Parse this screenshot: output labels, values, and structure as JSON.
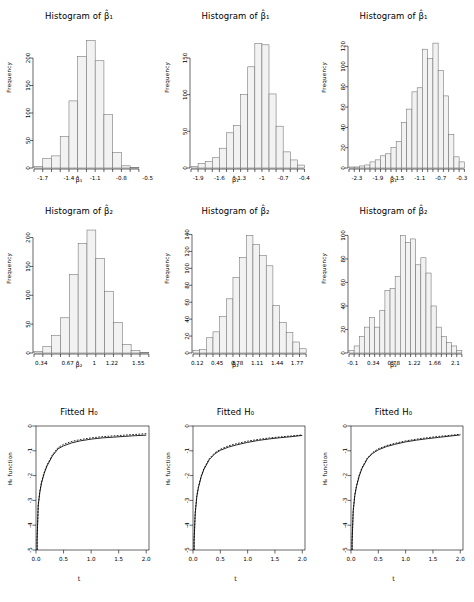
{
  "figure": {
    "layout": "3x3 panel grid",
    "rows": 3,
    "cols": 3
  },
  "labels": {
    "frequency": "Frequency",
    "h0_function": "H₀ function",
    "t": "t",
    "beta1_hat": "β̂₁",
    "beta2_hat": "β̂₂",
    "hist_title_b1": "Histogram of β̂₁",
    "hist_title_b2": "Histogram of β̂₂",
    "fitted_title": "Fitted H₀"
  },
  "chart_data": [
    {
      "id": "hist-b1-col1",
      "type": "bar",
      "title": "Histogram of β̂₁",
      "xlabel": "β̂₁",
      "ylabel": "Frequency",
      "xlim": [
        -1.8,
        -0.45
      ],
      "ylim": [
        0,
        240
      ],
      "xticks": [
        "-1.7",
        "-1.4",
        "-1.1",
        "-0.8",
        "-0.5"
      ],
      "xtickvals": [
        -1.7,
        -1.4,
        -1.1,
        -0.8,
        -0.5
      ],
      "yticks": [
        "0",
        "50",
        "100",
        "150",
        "200"
      ],
      "ytickvals": [
        0,
        50,
        100,
        150,
        200
      ],
      "bin_edges": [
        -1.8,
        -1.7,
        -1.6,
        -1.5,
        -1.4,
        -1.3,
        -1.2,
        -1.1,
        -1.0,
        -0.9,
        -0.8,
        -0.7,
        -0.6
      ],
      "values": [
        3,
        17,
        22,
        57,
        122,
        203,
        232,
        195,
        97,
        28,
        4,
        1
      ],
      "grid": false,
      "legend": "none"
    },
    {
      "id": "hist-b1-col2",
      "type": "bar",
      "title": "Histogram of β̂₁",
      "xlabel": "β̂₁",
      "ylabel": "Frequency",
      "xlim": [
        -2.0,
        -0.35
      ],
      "ylim": [
        0,
        180
      ],
      "xticks": [
        "-1.9",
        "-1.6",
        "-1.3",
        "-1",
        "-0.7",
        "-0.4"
      ],
      "xtickvals": [
        -1.9,
        -1.6,
        -1.3,
        -1.0,
        -0.7,
        -0.4
      ],
      "yticks": [
        "0",
        "50",
        "100",
        "150"
      ],
      "ytickvals": [
        0,
        50,
        100,
        150
      ],
      "bin_edges": [
        -2.0,
        -1.9,
        -1.8,
        -1.7,
        -1.6,
        -1.5,
        -1.4,
        -1.3,
        -1.2,
        -1.1,
        -1.0,
        -0.9,
        -0.8,
        -0.7,
        -0.6,
        -0.5,
        -0.4
      ],
      "values": [
        2,
        6,
        9,
        14,
        27,
        48,
        58,
        100,
        138,
        170,
        168,
        101,
        57,
        22,
        11,
        4
      ],
      "grid": false,
      "legend": "none"
    },
    {
      "id": "hist-b1-col3",
      "type": "bar",
      "title": "Histogram of β̂₁",
      "xlabel": "β̂₁",
      "ylabel": "Frequency",
      "xlim": [
        -2.45,
        -0.2
      ],
      "ylim": [
        0,
        130
      ],
      "xticks": [
        "-2.3",
        "-1.9",
        "-1.5",
        "-1.1",
        "-0.7",
        "-0.3"
      ],
      "xtickvals": [
        -2.3,
        -1.9,
        -1.5,
        -1.1,
        -0.7,
        -0.3
      ],
      "yticks": [
        "0",
        "20",
        "40",
        "60",
        "80",
        "100",
        "120"
      ],
      "ytickvals": [
        0,
        20,
        40,
        60,
        80,
        100,
        120
      ],
      "bin_edges": [
        -2.45,
        -2.35,
        -2.25,
        -2.15,
        -2.05,
        -1.95,
        -1.85,
        -1.75,
        -1.65,
        -1.55,
        -1.45,
        -1.35,
        -1.25,
        -1.15,
        -1.05,
        -0.95,
        -0.85,
        -0.75,
        -0.65,
        -0.55,
        -0.45,
        -0.35,
        -0.25
      ],
      "values": [
        1,
        1,
        2,
        3,
        6,
        8,
        12,
        14,
        20,
        26,
        45,
        58,
        75,
        79,
        117,
        108,
        123,
        96,
        71,
        33,
        11,
        6
      ],
      "grid": false,
      "legend": "none"
    },
    {
      "id": "hist-b2-col1",
      "type": "bar",
      "title": "Histogram of β̂₂",
      "xlabel": "β̂₂",
      "ylabel": "Frequency",
      "xlim": [
        0.25,
        1.72
      ],
      "ylim": [
        0,
        220
      ],
      "xticks": [
        "0.34",
        "0.67",
        "1",
        "1.22",
        "1.55"
      ],
      "xtickvals": [
        0.34,
        0.67,
        1.0,
        1.22,
        1.55
      ],
      "yticks": [
        "0",
        "50",
        "100",
        "150",
        "200"
      ],
      "ytickvals": [
        0,
        50,
        100,
        150,
        200
      ],
      "bin_edges": [
        0.25,
        0.36,
        0.47,
        0.58,
        0.69,
        0.8,
        0.91,
        1.02,
        1.13,
        1.24,
        1.35,
        1.46,
        1.57,
        1.68
      ],
      "values": [
        3,
        11,
        30,
        61,
        136,
        190,
        213,
        164,
        107,
        53,
        15,
        4,
        1
      ],
      "grid": false,
      "legend": "none"
    },
    {
      "id": "hist-b2-col2",
      "type": "bar",
      "title": "Histogram of β̂₂",
      "xlabel": "β̂₂",
      "ylabel": "Frequency",
      "xlim": [
        0.05,
        1.95
      ],
      "ylim": [
        0,
        150
      ],
      "xticks": [
        "0.12",
        "0.45",
        "0.78",
        "1.11",
        "1.44",
        "1.77"
      ],
      "xtickvals": [
        0.12,
        0.45,
        0.78,
        1.11,
        1.44,
        1.77
      ],
      "yticks": [
        "0",
        "20",
        "40",
        "60",
        "80",
        "100",
        "120",
        "140"
      ],
      "ytickvals": [
        0,
        20,
        40,
        60,
        80,
        100,
        120,
        140
      ],
      "bin_edges": [
        0.05,
        0.16,
        0.27,
        0.38,
        0.49,
        0.6,
        0.71,
        0.82,
        0.93,
        1.04,
        1.15,
        1.26,
        1.37,
        1.48,
        1.59,
        1.7,
        1.81,
        1.92
      ],
      "values": [
        3,
        4,
        18,
        25,
        43,
        64,
        89,
        113,
        139,
        128,
        115,
        103,
        56,
        36,
        24,
        13,
        5
      ],
      "grid": false,
      "legend": "none"
    },
    {
      "id": "hist-b2-col3",
      "type": "bar",
      "title": "Histogram of β̂₂",
      "xlabel": "β̂₂",
      "ylabel": "Frequency",
      "xlim": [
        -0.18,
        2.35
      ],
      "ylim": [
        0,
        108
      ],
      "xticks": [
        "-0.1",
        "0.34",
        "0.78",
        "1.22",
        "1.66",
        "2.1"
      ],
      "xtickvals": [
        -0.1,
        0.34,
        0.78,
        1.22,
        1.66,
        2.1
      ],
      "bin_edges": [
        -0.18,
        -0.07,
        0.04,
        0.15,
        0.26,
        0.37,
        0.48,
        0.59,
        0.7,
        0.81,
        0.92,
        1.03,
        1.14,
        1.25,
        1.36,
        1.47,
        1.58,
        1.69,
        1.8,
        1.91,
        2.02,
        2.13,
        2.24
      ],
      "yticks": [
        "0",
        "20",
        "40",
        "60",
        "80",
        "100"
      ],
      "ytickvals": [
        0,
        20,
        40,
        60,
        80,
        100
      ],
      "values": [
        2,
        6,
        14,
        22,
        30,
        22,
        36,
        53,
        55,
        65,
        100,
        94,
        97,
        75,
        81,
        68,
        40,
        22,
        14,
        9,
        6,
        2
      ],
      "grid": false,
      "legend": "none"
    },
    {
      "id": "fitted-h0-col1",
      "type": "line",
      "title": "Fitted H₀",
      "xlabel": "t",
      "ylabel": "H₀ function",
      "xlim": [
        0,
        2.05
      ],
      "ylim": [
        -5,
        0
      ],
      "xticks": [
        "0.0",
        "0.5",
        "1.0",
        "1.5",
        "2.0"
      ],
      "xtickvals": [
        0.0,
        0.5,
        1.0,
        1.5,
        2.0
      ],
      "yticks": [
        "0",
        "-1",
        "-2",
        "-3",
        "-4",
        "-5"
      ],
      "ytickvals": [
        0,
        -1,
        -2,
        -3,
        -4,
        -5
      ],
      "grid": false,
      "legend": "none",
      "series": [
        {
          "name": "true",
          "style": "solid",
          "x": [
            0.02,
            0.04,
            0.07,
            0.1,
            0.15,
            0.2,
            0.3,
            0.4,
            0.5,
            0.65,
            0.8,
            1.0,
            1.2,
            1.4,
            1.6,
            1.8,
            2.0
          ],
          "y": [
            -4.6,
            -3.22,
            -2.66,
            -2.3,
            -1.9,
            -1.61,
            -1.2,
            -0.92,
            -0.8,
            -0.68,
            -0.6,
            -0.53,
            -0.48,
            -0.45,
            -0.42,
            -0.39,
            -0.37
          ]
        },
        {
          "name": "fitted",
          "style": "dashed",
          "x": [
            0.02,
            0.04,
            0.07,
            0.1,
            0.15,
            0.2,
            0.3,
            0.4,
            0.5,
            0.65,
            0.8,
            1.0,
            1.2,
            1.4,
            1.6,
            1.8,
            2.0
          ],
          "y": [
            -4.55,
            -3.18,
            -2.62,
            -2.26,
            -1.86,
            -1.57,
            -1.15,
            -0.87,
            -0.74,
            -0.62,
            -0.55,
            -0.48,
            -0.43,
            -0.4,
            -0.37,
            -0.34,
            -0.31
          ]
        }
      ]
    },
    {
      "id": "fitted-h0-col2",
      "type": "line",
      "title": "Fitted H₀",
      "xlabel": "t",
      "ylabel": "H₀ function",
      "xlim": [
        0,
        2.05
      ],
      "ylim": [
        -5,
        0
      ],
      "xticks": [
        "0.0",
        "0.5",
        "1.0",
        "1.5",
        "2.0"
      ],
      "xtickvals": [
        0.0,
        0.5,
        1.0,
        1.5,
        2.0
      ],
      "yticks": [
        "0",
        "-1",
        "-2",
        "-3",
        "-4",
        "-5"
      ],
      "ytickvals": [
        0,
        -1,
        -2,
        -3,
        -4,
        -5
      ],
      "grid": false,
      "legend": "none",
      "series": [
        {
          "name": "true",
          "style": "solid",
          "x": [
            0.02,
            0.04,
            0.07,
            0.1,
            0.15,
            0.2,
            0.3,
            0.4,
            0.5,
            0.65,
            0.8,
            1.0,
            1.2,
            1.4,
            1.6,
            1.8,
            2.0
          ],
          "y": [
            -4.65,
            -3.55,
            -2.85,
            -2.48,
            -2.05,
            -1.75,
            -1.35,
            -1.12,
            -0.98,
            -0.85,
            -0.76,
            -0.66,
            -0.58,
            -0.52,
            -0.47,
            -0.43,
            -0.38
          ]
        },
        {
          "name": "fitted",
          "style": "dashed",
          "x": [
            0.02,
            0.04,
            0.07,
            0.1,
            0.15,
            0.2,
            0.3,
            0.4,
            0.5,
            0.65,
            0.8,
            1.0,
            1.2,
            1.4,
            1.6,
            1.8,
            2.0
          ],
          "y": [
            -4.6,
            -3.5,
            -2.8,
            -2.44,
            -2.01,
            -1.71,
            -1.31,
            -1.08,
            -0.94,
            -0.8,
            -0.71,
            -0.61,
            -0.54,
            -0.48,
            -0.44,
            -0.4,
            -0.36
          ]
        }
      ]
    },
    {
      "id": "fitted-h0-col3",
      "type": "line",
      "title": "Fitted H₀",
      "xlabel": "t",
      "ylabel": "H₀ function",
      "xlim": [
        0,
        2.05
      ],
      "ylim": [
        -5,
        0
      ],
      "xticks": [
        "0.0",
        "0.5",
        "1.0",
        "1.5",
        "2.0"
      ],
      "xtickvals": [
        0.0,
        0.5,
        1.0,
        1.5,
        2.0
      ],
      "yticks": [
        "0",
        "-1",
        "-2",
        "-3",
        "-4",
        "-5"
      ],
      "ytickvals": [
        0,
        -1,
        -2,
        -3,
        -4,
        -5
      ],
      "grid": false,
      "legend": "none",
      "series": [
        {
          "name": "true",
          "style": "solid",
          "x": [
            0.02,
            0.04,
            0.07,
            0.1,
            0.15,
            0.2,
            0.3,
            0.4,
            0.5,
            0.65,
            0.8,
            1.0,
            1.2,
            1.4,
            1.6,
            1.8,
            2.0
          ],
          "y": [
            -4.7,
            -3.45,
            -2.8,
            -2.45,
            -2.02,
            -1.72,
            -1.32,
            -1.1,
            -0.96,
            -0.83,
            -0.74,
            -0.64,
            -0.57,
            -0.51,
            -0.46,
            -0.41,
            -0.36
          ]
        },
        {
          "name": "fitted",
          "style": "dashed",
          "x": [
            0.02,
            0.04,
            0.07,
            0.1,
            0.15,
            0.2,
            0.3,
            0.4,
            0.5,
            0.65,
            0.8,
            1.0,
            1.2,
            1.4,
            1.6,
            1.8,
            2.0
          ],
          "y": [
            -4.65,
            -3.4,
            -2.76,
            -2.41,
            -1.98,
            -1.68,
            -1.28,
            -1.06,
            -0.92,
            -0.79,
            -0.7,
            -0.6,
            -0.53,
            -0.47,
            -0.42,
            -0.38,
            -0.33
          ]
        }
      ]
    }
  ]
}
